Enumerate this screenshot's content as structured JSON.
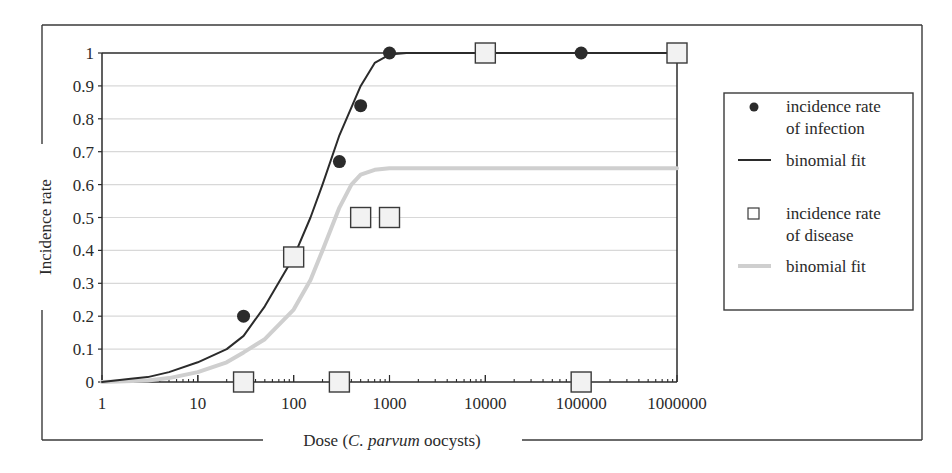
{
  "chart_data": {
    "type": "scatter",
    "title": "",
    "xlabel": "Dose (C. parvum oocysts)",
    "xlabel_parts": [
      {
        "text": "Dose (",
        "italic": false
      },
      {
        "text": "C. parvum",
        "italic": true
      },
      {
        "text": " oocysts)",
        "italic": false
      }
    ],
    "ylabel": "Incidence rate",
    "xscale": "log",
    "xlim": [
      1,
      1000000
    ],
    "ylim": [
      0,
      1
    ],
    "xticks": [
      1,
      10,
      100,
      1000,
      10000,
      100000,
      1000000
    ],
    "xtick_labels": [
      "1",
      "10",
      "100",
      "1000",
      "10000",
      "100000",
      "1000000"
    ],
    "yticks": [
      0,
      0.1,
      0.2,
      0.3,
      0.4,
      0.5,
      0.6,
      0.7,
      0.8,
      0.9,
      1
    ],
    "ytick_labels": [
      "0",
      "0.1",
      "0.2",
      "0.3",
      "0.4",
      "0.5",
      "0.6",
      "0.7",
      "0.8",
      "0.9",
      "1"
    ],
    "grid": {
      "horizontal": true,
      "vertical": false
    },
    "legend_position": "right",
    "series": [
      {
        "name": "incidence rate of infection",
        "legend_lines": [
          "incidence rate",
          "of infection"
        ],
        "kind": "scatter",
        "marker": "circle",
        "color": "#2b2b2b",
        "x": [
          30,
          300,
          500,
          1000,
          100000
        ],
        "y": [
          0.2,
          0.67,
          0.84,
          1.0,
          1.0
        ]
      },
      {
        "name": "binomial fit",
        "legend_lines": [
          "binomial fit"
        ],
        "kind": "line",
        "color": "#2b2b2b",
        "width": 2,
        "x": [
          1,
          2,
          3,
          5,
          10,
          20,
          30,
          50,
          100,
          150,
          200,
          300,
          500,
          700,
          1000,
          1500,
          1000000
        ],
        "y": [
          0,
          0.01,
          0.015,
          0.03,
          0.06,
          0.1,
          0.14,
          0.23,
          0.38,
          0.5,
          0.6,
          0.75,
          0.9,
          0.97,
          0.995,
          1.0,
          1.0
        ]
      },
      {
        "name": "incidence rate of disease",
        "legend_lines": [
          "incidence rate",
          "of disease"
        ],
        "kind": "scatter",
        "marker": "square",
        "color": "#3a3a3a",
        "fill": "#f2f2f2",
        "x": [
          30,
          100,
          300,
          500,
          1000,
          10000,
          100000,
          1000000
        ],
        "y": [
          0,
          0.38,
          0,
          0.5,
          0.5,
          1.0,
          0,
          1.0
        ]
      },
      {
        "name": "binomial fit",
        "legend_lines": [
          "binomial fit"
        ],
        "kind": "line",
        "color": "#cfcfcf",
        "width": 4,
        "x": [
          1,
          3,
          5,
          10,
          20,
          30,
          50,
          100,
          150,
          200,
          300,
          400,
          500,
          700,
          1000,
          1500,
          1000000
        ],
        "y": [
          0,
          0.005,
          0.012,
          0.03,
          0.06,
          0.09,
          0.13,
          0.22,
          0.31,
          0.4,
          0.53,
          0.6,
          0.63,
          0.645,
          0.65,
          0.65,
          0.65
        ]
      }
    ]
  },
  "layout_colors": {
    "frame": "#3a3a3a",
    "grid": "#d8d8d8",
    "axis": "#2b2b2b"
  }
}
